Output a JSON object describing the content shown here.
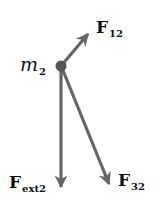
{
  "diagram": {
    "title": "",
    "type": "free-body diagram",
    "colors": {
      "arrow": "#666666",
      "dot": "#555555",
      "text": "#111111"
    },
    "body": {
      "symbol": "m",
      "subscript": "2"
    },
    "forces": [
      {
        "id": "F12",
        "symbol": "F",
        "subscript": "12",
        "direction": "up-right"
      },
      {
        "id": "Fext2",
        "symbol": "F",
        "subscript": "ext2",
        "direction": "down"
      },
      {
        "id": "F32",
        "symbol": "F",
        "subscript": "32",
        "direction": "down-right"
      }
    ]
  }
}
